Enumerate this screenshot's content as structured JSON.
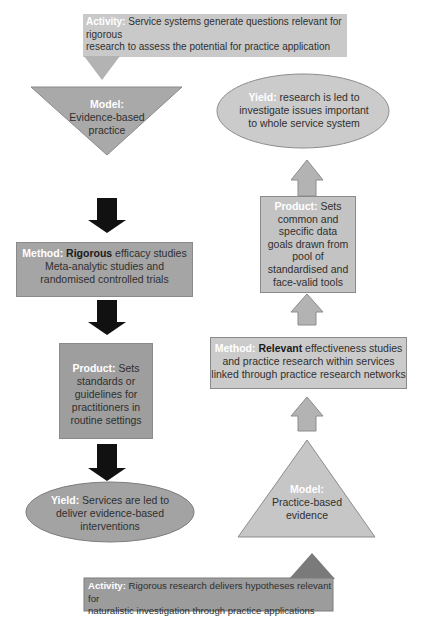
{
  "colors": {
    "light_gray": "#c9c9c9",
    "mid_gray": "#a6a6a6",
    "dark_gray": "#8f8f8f",
    "arrow_black": "#111111",
    "bottom_pointer": "#7a7a7a",
    "label_white": "#ffffff"
  },
  "top_activity": {
    "label": "Activity:",
    "text_line1": " Service systems generate questions relevant for rigorous",
    "text_line2": "research to assess the potential for practice application"
  },
  "left_column": {
    "model": {
      "label": "Model:",
      "line1": "Evidence-based",
      "line2": "practice"
    },
    "method": {
      "label": "Method:",
      "emphasis": " Rigorous",
      "line1_rest": " efficacy studies",
      "line2": "Meta-analytic studies and",
      "line3": "randomised controlled trials"
    },
    "product": {
      "label": "Product:",
      "line1_rest": " Sets",
      "line2": "standards or",
      "line3": "guidelines for",
      "line4": "practitioners in",
      "line5": "routine settings"
    },
    "yield": {
      "label": "Yield:",
      "line1_rest": " Services are led to",
      "line2": "deliver evidence-based",
      "line3": "interventions"
    }
  },
  "right_column": {
    "yield": {
      "label": "Yield:",
      "line1_rest": " research is led to",
      "line2": "investigate issues important",
      "line3": "to whole service system"
    },
    "product": {
      "label": "Product:",
      "line1_rest": " Sets",
      "line2": "common and",
      "line3": "specific data",
      "line4": "goals drawn from",
      "line5": "pool of",
      "line6": "standardised and",
      "line7": "face-valid tools"
    },
    "method": {
      "label": "Method:",
      "emphasis": " Relevant",
      "line1_rest": " effectiveness studies",
      "line2": "and practice research within services",
      "line3": "linked through practice research networks"
    },
    "model": {
      "label": "Model:",
      "line1": "Practice-based",
      "line2": "evidence"
    }
  },
  "bottom_activity": {
    "label": "Activity:",
    "text_line1": " Rigorous research delivers hypotheses relevant for",
    "text_line2": "naturalistic investigation through practice applications"
  }
}
